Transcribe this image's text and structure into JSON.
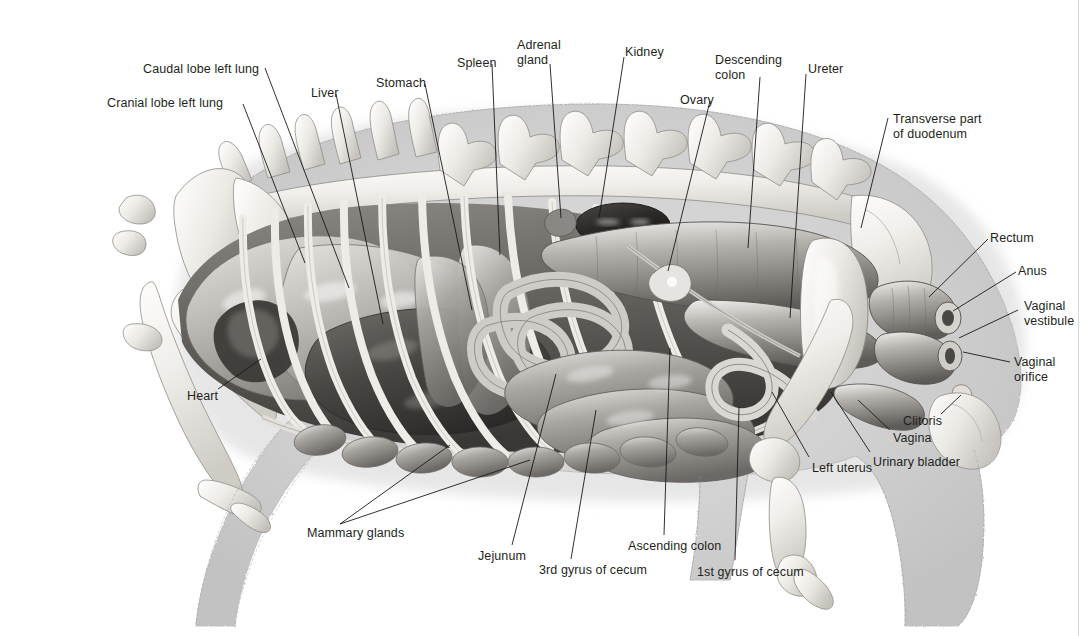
{
  "figure": {
    "width": 1081,
    "height": 636,
    "background": "#ffffff",
    "label_color": "#231f20",
    "leader_color": "#1a1a1a",
    "body_fill": "#cdcdcd",
    "organ_dark": "#3a3a3a",
    "bone_fill": "#f2f1ef"
  },
  "labels": [
    {
      "id": "cranial-lobe-left-lung",
      "text": "Cranial lobe left lung",
      "lines": [
        "Cranial lobe left lung"
      ],
      "x": 107,
      "y": 96,
      "align": "left"
    },
    {
      "id": "caudal-lobe-left-lung",
      "text": "Caudal lobe left lung",
      "lines": [
        "Caudal lobe left lung"
      ],
      "x": 143,
      "y": 62,
      "align": "left"
    },
    {
      "id": "liver",
      "text": "Liver",
      "lines": [
        "Liver"
      ],
      "x": 311,
      "y": 86,
      "align": "left"
    },
    {
      "id": "stomach",
      "text": "Stomach",
      "lines": [
        "Stomach"
      ],
      "x": 376,
      "y": 76,
      "align": "left"
    },
    {
      "id": "spleen",
      "text": "Spleen",
      "lines": [
        "Spleen"
      ],
      "x": 457,
      "y": 56,
      "align": "left"
    },
    {
      "id": "adrenal-gland",
      "text": "Adrenal gland",
      "lines": [
        "Adrenal",
        "gland"
      ],
      "x": 517,
      "y": 38,
      "align": "left"
    },
    {
      "id": "kidney",
      "text": "Kidney",
      "lines": [
        "Kidney"
      ],
      "x": 625,
      "y": 45,
      "align": "left"
    },
    {
      "id": "ovary",
      "text": "Ovary",
      "lines": [
        "Ovary"
      ],
      "x": 680,
      "y": 93,
      "align": "left"
    },
    {
      "id": "descending-colon",
      "text": "Descending colon",
      "lines": [
        "Descending",
        "colon"
      ],
      "x": 715,
      "y": 53,
      "align": "left"
    },
    {
      "id": "ureter",
      "text": "Ureter",
      "lines": [
        "Ureter"
      ],
      "x": 808,
      "y": 62,
      "align": "left"
    },
    {
      "id": "transverse-part-of-duodenum",
      "text": "Transverse part of duodenum",
      "lines": [
        "Transverse part",
        "of duodenum"
      ],
      "x": 893,
      "y": 112,
      "align": "left"
    },
    {
      "id": "rectum",
      "text": "Rectum",
      "lines": [
        "Rectum"
      ],
      "x": 990,
      "y": 231,
      "align": "left"
    },
    {
      "id": "anus",
      "text": "Anus",
      "lines": [
        "Anus"
      ],
      "x": 1018,
      "y": 264,
      "align": "left"
    },
    {
      "id": "vaginal-vestibule",
      "text": "Vaginal vestibule",
      "lines": [
        "Vaginal",
        "vestibule"
      ],
      "x": 1024,
      "y": 299,
      "align": "left"
    },
    {
      "id": "vaginal-orifice",
      "text": "Vaginal orifice",
      "lines": [
        "Vaginal",
        "orifice"
      ],
      "x": 1014,
      "y": 355,
      "align": "left"
    },
    {
      "id": "clitoris",
      "text": "Clitoris",
      "lines": [
        "Clitoris"
      ],
      "x": 903,
      "y": 414,
      "align": "left"
    },
    {
      "id": "vagina",
      "text": "Vagina",
      "lines": [
        "Vagina"
      ],
      "x": 893,
      "y": 431,
      "align": "left"
    },
    {
      "id": "urinary-bladder",
      "text": "Urinary bladder",
      "lines": [
        "Urinary bladder"
      ],
      "x": 873,
      "y": 455,
      "align": "left"
    },
    {
      "id": "left-uterus",
      "text": "Left uterus",
      "lines": [
        "Left uterus"
      ],
      "x": 812,
      "y": 461,
      "align": "left"
    },
    {
      "id": "heart",
      "text": "Heart",
      "lines": [
        "Heart"
      ],
      "x": 187,
      "y": 389,
      "align": "left"
    },
    {
      "id": "mammary-glands",
      "text": "Mammary glands",
      "lines": [
        "Mammary glands"
      ],
      "x": 307,
      "y": 526,
      "align": "left"
    },
    {
      "id": "jejunum",
      "text": "Jejunum",
      "lines": [
        "Jejunum"
      ],
      "x": 478,
      "y": 549,
      "align": "left"
    },
    {
      "id": "3rd-gyrus-of-cecum",
      "text": "3rd gyrus of cecum",
      "lines": [
        "3rd gyrus of cecum"
      ],
      "x": 539,
      "y": 563,
      "align": "left"
    },
    {
      "id": "ascending-colon",
      "text": "Ascending colon",
      "lines": [
        "Ascending colon"
      ],
      "x": 628,
      "y": 539,
      "align": "left"
    },
    {
      "id": "1st-gyrus-of-cecum",
      "text": "1st gyrus of cecum",
      "lines": [
        "1st gyrus of cecum"
      ],
      "x": 697,
      "y": 565,
      "align": "left"
    }
  ],
  "leaders": [
    {
      "id": "leader-cranial-lobe-left-lung",
      "points": "243,104 305,263"
    },
    {
      "id": "leader-caudal-lobe-left-lung",
      "points": "265,68 349,288"
    },
    {
      "id": "leader-liver",
      "points": "336,94 383,324"
    },
    {
      "id": "leader-stomach",
      "points": "425,84 472,310"
    },
    {
      "id": "leader-spleen",
      "points": "492,64 500,255"
    },
    {
      "id": "leader-adrenal-gland",
      "points": "550,64 561,218"
    },
    {
      "id": "leader-kidney",
      "points": "624,57 599,218"
    },
    {
      "id": "leader-ovary",
      "points": "710,101 668,271"
    },
    {
      "id": "leader-descending-colon",
      "points": "760,77 748,248"
    },
    {
      "id": "leader-ureter",
      "points": "806,74 790,318"
    },
    {
      "id": "leader-transverse-part-of-duodenum",
      "points": "888,118 861,228"
    },
    {
      "id": "leader-rectum",
      "points": "988,239 929,297"
    },
    {
      "id": "leader-anus",
      "points": "1016,272 953,311"
    },
    {
      "id": "leader-vaginal-vestibule",
      "points": "1018,310 959,338"
    },
    {
      "id": "leader-vaginal-orifice",
      "points": "1010,362 963,352"
    },
    {
      "id": "leader-clitoris",
      "points": "941,414 961,395"
    },
    {
      "id": "leader-vagina",
      "points": "890,430 858,400"
    },
    {
      "id": "leader-urinary-bladder",
      "points": "870,452 831,392"
    },
    {
      "id": "leader-left-uterus",
      "points": "809,457 772,392"
    },
    {
      "id": "leader-heart",
      "points": "218,389 261,359"
    },
    {
      "id": "leader-mammary-glands-a",
      "points": "340,524 450,445"
    },
    {
      "id": "leader-mammary-glands-b",
      "points": "340,524 530,460"
    },
    {
      "id": "leader-jejunum",
      "points": "512,545 556,374"
    },
    {
      "id": "leader-3rd-gyrus-of-cecum",
      "points": "571,559 596,410"
    },
    {
      "id": "leader-ascending-colon",
      "points": "664,535 670,348"
    },
    {
      "id": "leader-1st-gyrus-of-cecum",
      "points": "735,560 739,407"
    }
  ],
  "icons": {
    "figure_kind": "anatomical-illustration-icon"
  }
}
